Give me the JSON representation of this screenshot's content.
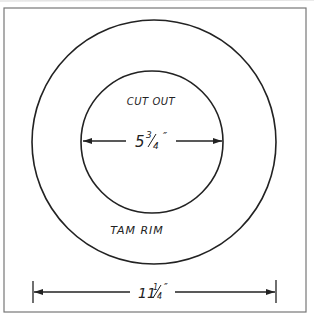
{
  "diagram": {
    "type": "technical-drawing",
    "colors": {
      "background": "#ffffff",
      "ink": "#222222",
      "frame": "#777777"
    },
    "labels": {
      "inner_region": "CUT OUT",
      "outer_region": "TAM RIM"
    },
    "dimensions": {
      "inner_diameter": {
        "whole": "5",
        "numerator": "3",
        "denominator": "4",
        "unit": "″",
        "text": "5 3/4\""
      },
      "outer_diameter": {
        "whole": "11",
        "numerator": "1",
        "denominator": "4",
        "unit": "″",
        "text": "11 1/4\""
      }
    },
    "shapes": {
      "outer_circle": {
        "cx": 154,
        "cy": 142,
        "r": 122
      },
      "inner_circle": {
        "cx": 152,
        "cy": 142,
        "r": 71
      }
    }
  }
}
